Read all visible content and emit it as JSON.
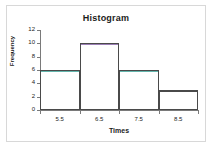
{
  "chart_data": {
    "type": "bar",
    "title": "Histogram",
    "xlabel": "Times",
    "ylabel": "Frequency",
    "categories": [
      "5.5",
      "6.5",
      "7.5",
      "8.5"
    ],
    "bin_edges": [
      5.0,
      6.0,
      7.0,
      8.0,
      9.0
    ],
    "values": [
      6,
      10,
      6,
      3
    ],
    "xtick_labels": [
      "5.5",
      "6.5",
      "7.5",
      "8.5"
    ],
    "ytick_labels": [
      "0",
      "2",
      "4",
      "6",
      "8",
      "10",
      "12"
    ],
    "ytick_values": [
      0,
      2,
      4,
      6,
      8,
      10,
      12
    ],
    "ylim": [
      0,
      12
    ],
    "xlim": [
      5.0,
      9.0
    ],
    "grid": false,
    "legend": null,
    "bar_outline_color": "#4a4a4a",
    "bar_fill_color": "#ffffff",
    "bar_cap_colors": [
      "#63b5ac",
      "#9b7fb5",
      "#63b5ac",
      "#4a4a4a"
    ],
    "axis_color": "#7a7a7a",
    "frame_color": "#d8d8d8",
    "background_color": "#ffffff",
    "text_color": "#1b1b1b"
  }
}
